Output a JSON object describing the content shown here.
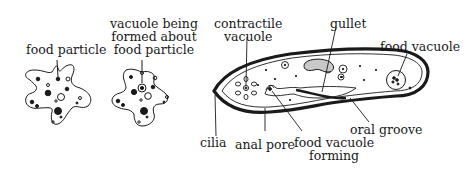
{
  "figure": {
    "panels": [
      {
        "id": "amoeba-1",
        "labels": [
          {
            "id": "food-particle",
            "text": "food particle"
          }
        ]
      },
      {
        "id": "amoeba-2",
        "labels": [
          {
            "id": "vacuole-forming",
            "lines": [
              "vacuole being",
              "formed about",
              "food particle"
            ]
          }
        ]
      },
      {
        "id": "paramecium",
        "labels": [
          {
            "id": "contractile-vacuole",
            "lines": [
              "contractile",
              "vacuole"
            ]
          },
          {
            "id": "gullet",
            "text": "gullet"
          },
          {
            "id": "food-vacuole",
            "text": "food vacuole"
          },
          {
            "id": "cilia",
            "text": "cilia"
          },
          {
            "id": "anal-pore",
            "text": "anal pore"
          },
          {
            "id": "food-vacuole-forming",
            "lines": [
              "food vacuole",
              "forming"
            ]
          },
          {
            "id": "oral-groove",
            "text": "oral groove"
          }
        ]
      }
    ],
    "colors": {
      "ink": "#1a1a1a",
      "background": "#ffffff",
      "gullet_fill": "#c8c8c8"
    }
  }
}
